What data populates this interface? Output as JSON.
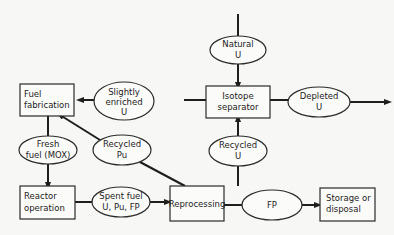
{
  "diagram": {
    "type": "fuel-cycle-flowchart",
    "nodes": {
      "natural_u": {
        "lines": [
          "Natural",
          "U"
        ],
        "shape": "ellipse"
      },
      "isotope_separator": {
        "lines": [
          "Isotope",
          "separator"
        ],
        "shape": "box"
      },
      "depleted_u": {
        "lines": [
          "Depleted",
          "U"
        ],
        "shape": "ellipse"
      },
      "slightly_enriched_u": {
        "lines": [
          "Slightly",
          "enriched",
          "U"
        ],
        "shape": "ellipse"
      },
      "fuel_fabrication": {
        "lines": [
          "Fuel",
          "fabrication"
        ],
        "shape": "box"
      },
      "fresh_fuel": {
        "lines": [
          "Fresh",
          "fuel (MOX)"
        ],
        "shape": "ellipse"
      },
      "recycled_pu": {
        "lines": [
          "Recycled",
          "Pu"
        ],
        "shape": "ellipse"
      },
      "recycled_u": {
        "lines": [
          "Recycled",
          "U"
        ],
        "shape": "ellipse"
      },
      "reactor_operation": {
        "lines": [
          "Reactor",
          "operation"
        ],
        "shape": "box"
      },
      "spent_fuel": {
        "lines": [
          "Spent fuel",
          "U, Pu, FP"
        ],
        "shape": "ellipse"
      },
      "reprocessing": {
        "lines": [
          "Reprocessing"
        ],
        "shape": "box"
      },
      "fp": {
        "lines": [
          "FP"
        ],
        "shape": "ellipse"
      },
      "storage": {
        "lines": [
          "Storage or",
          "disposal"
        ],
        "shape": "box"
      }
    },
    "edges": [
      {
        "from": "source",
        "to": "natural_u"
      },
      {
        "from": "natural_u",
        "to": "isotope_separator"
      },
      {
        "from": "isotope_separator",
        "to": "slightly_enriched_u"
      },
      {
        "from": "slightly_enriched_u",
        "to": "fuel_fabrication"
      },
      {
        "from": "isotope_separator",
        "to": "depleted_u"
      },
      {
        "from": "depleted_u",
        "to": "out"
      },
      {
        "from": "fuel_fabrication",
        "to": "fresh_fuel"
      },
      {
        "from": "fresh_fuel",
        "to": "reactor_operation"
      },
      {
        "from": "reactor_operation",
        "to": "spent_fuel"
      },
      {
        "from": "spent_fuel",
        "to": "reprocessing"
      },
      {
        "from": "reprocessing",
        "to": "recycled_pu"
      },
      {
        "from": "recycled_pu",
        "to": "fuel_fabrication"
      },
      {
        "from": "reprocessing",
        "to": "recycled_u"
      },
      {
        "from": "recycled_u",
        "to": "isotope_separator"
      },
      {
        "from": "reprocessing",
        "to": "fp"
      },
      {
        "from": "fp",
        "to": "storage"
      }
    ]
  }
}
